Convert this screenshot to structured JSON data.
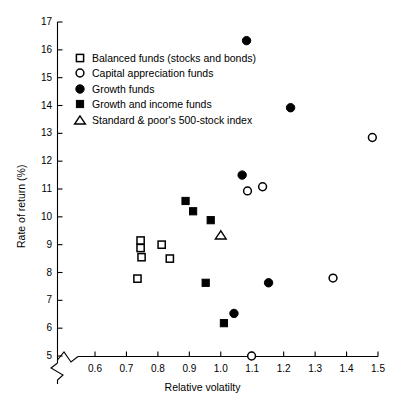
{
  "chart_data": {
    "type": "scatter",
    "title": "",
    "xlabel": "Relative volatilty",
    "ylabel": "Rate of return (%)",
    "xlim": [
      0.6,
      1.5
    ],
    "ylim": [
      5,
      17
    ],
    "xticks": [
      "0.6",
      "0.7",
      "0.8",
      "0.9",
      "1.0",
      "1.1",
      "1.2",
      "1.3",
      "1.4",
      "1.5"
    ],
    "xtick_values": [
      0.6,
      0.7,
      0.8,
      0.9,
      1.0,
      1.1,
      1.2,
      1.3,
      1.4,
      1.5
    ],
    "yticks": [
      "17",
      "16",
      "15",
      "14",
      "13",
      "12",
      "11",
      "10",
      "9",
      "8",
      "7",
      "6",
      "5"
    ],
    "ytick_values": [
      17,
      16,
      15,
      14,
      13,
      12,
      11,
      10,
      9,
      8,
      7,
      6,
      5
    ],
    "grid": false,
    "axis_break_x": true,
    "axis_break_y": true,
    "legend_position": "upper-left-inside",
    "marker_color": "#000000",
    "axis_color": "#000000",
    "series": [
      {
        "name": "Balanced funds (stocks and bonds)",
        "marker": "open-square",
        "points": [
          {
            "x": 0.745,
            "y": 9.15
          },
          {
            "x": 0.745,
            "y": 8.88
          },
          {
            "x": 0.748,
            "y": 8.55
          },
          {
            "x": 0.735,
            "y": 7.78
          },
          {
            "x": 0.812,
            "y": 9.0
          },
          {
            "x": 0.838,
            "y": 8.5
          }
        ]
      },
      {
        "name": "Capital appreciation funds",
        "marker": "open-circle",
        "points": [
          {
            "x": 1.482,
            "y": 12.85
          },
          {
            "x": 1.085,
            "y": 10.93
          },
          {
            "x": 1.133,
            "y": 11.08
          },
          {
            "x": 1.357,
            "y": 7.8
          },
          {
            "x": 1.098,
            "y": 5.0
          }
        ]
      },
      {
        "name": "Growth funds",
        "marker": "filled-circle",
        "points": [
          {
            "x": 1.082,
            "y": 16.33
          },
          {
            "x": 1.222,
            "y": 13.92
          },
          {
            "x": 1.068,
            "y": 11.5
          },
          {
            "x": 1.152,
            "y": 7.63
          },
          {
            "x": 1.042,
            "y": 6.53
          }
        ]
      },
      {
        "name": "Growth and income funds",
        "marker": "filled-square",
        "points": [
          {
            "x": 0.888,
            "y": 10.57
          },
          {
            "x": 0.912,
            "y": 10.2
          },
          {
            "x": 0.968,
            "y": 9.88
          },
          {
            "x": 0.952,
            "y": 7.63
          },
          {
            "x": 1.01,
            "y": 6.18
          }
        ]
      },
      {
        "name": "Standard & poor's 500-stock index",
        "marker": "open-triangle",
        "points": [
          {
            "x": 1.0,
            "y": 9.35
          }
        ]
      }
    ]
  },
  "legend": {
    "items": [
      {
        "label": "Balanced funds (stocks and bonds)",
        "marker": "open-square"
      },
      {
        "label": "Capital appreciation funds",
        "marker": "open-circle"
      },
      {
        "label": "Growth funds",
        "marker": "filled-circle"
      },
      {
        "label": "Growth and income funds",
        "marker": "filled-square"
      },
      {
        "label": "Standard & poor's 500-stock index",
        "marker": "open-triangle"
      }
    ]
  }
}
